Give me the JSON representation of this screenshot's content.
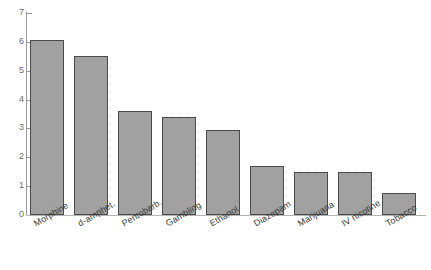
{
  "chart_data": {
    "type": "bar",
    "title": "",
    "subtitle": "",
    "xlabel": "",
    "ylabel": "",
    "categories": [
      "Morphine",
      "d-amphet.",
      "Pentobarb.",
      "Gambling",
      "Ethanol",
      "Diazepam",
      "Marijuana",
      "IV nicotine",
      "Tobacco"
    ],
    "values": [
      6.05,
      5.5,
      3.6,
      3.4,
      2.95,
      1.7,
      1.5,
      1.5,
      0.75
    ],
    "ylim": [
      0,
      7
    ],
    "ytick_labels": [
      "0",
      "1",
      "2",
      "3",
      "4",
      "5",
      "6",
      "7"
    ],
    "ytick_values": [
      0,
      1,
      2,
      3,
      4,
      5,
      6,
      7
    ],
    "grid": false,
    "legend": null,
    "legend_position": "none",
    "annotations": [],
    "bar_fill_color": "#a8a8a8",
    "bar_edge_color": "#4a4a4a",
    "axis_color": "#9a9a9a",
    "background_color": "#ffffff"
  }
}
